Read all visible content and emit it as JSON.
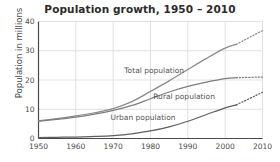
{
  "chart_data": {
    "type": "line",
    "title": "Population growth, 1950 – 2010",
    "xlabel": "",
    "ylabel": "Population in millions",
    "xlim": [
      1950,
      2010
    ],
    "ylim": [
      0,
      40
    ],
    "grid": true,
    "legend_position": "inline-labels",
    "xticks": [
      "1950",
      "1960",
      "1970",
      "1980",
      "1990",
      "2000",
      "2010"
    ],
    "yticks": [
      "0",
      "10",
      "20",
      "30",
      "40"
    ],
    "x": [
      1950,
      1955,
      1960,
      1965,
      1970,
      1975,
      1980,
      1985,
      1990,
      1995,
      2000,
      2003,
      2010
    ],
    "series": [
      {
        "name": "Total population",
        "label": "Total population",
        "color": "#8a8a8a",
        "values": [
          6.1,
          6.8,
          7.7,
          8.8,
          10.2,
          12.6,
          16.1,
          19.7,
          23.6,
          27.4,
          30.9,
          32.2,
          36.9
        ],
        "solid_until": 2003,
        "projection_style": "dotted"
      },
      {
        "name": "Rural population",
        "label": "Rural population",
        "color": "#7d7d7d",
        "values": [
          5.9,
          6.5,
          7.3,
          8.3,
          9.6,
          11.3,
          13.6,
          15.9,
          17.8,
          19.3,
          20.5,
          20.8,
          21.0
        ],
        "solid_until": 2003,
        "projection_style": "dotted"
      },
      {
        "name": "Urban population",
        "label": "Urban population",
        "color": "#5f5f5f",
        "values": [
          0.3,
          0.4,
          0.5,
          0.7,
          1.0,
          1.6,
          2.6,
          4.0,
          5.9,
          8.2,
          10.5,
          11.5,
          15.8
        ],
        "solid_until": 2003,
        "projection_style": "dotted"
      }
    ],
    "annotations": [
      {
        "text": "Total population",
        "x": 1981,
        "y": 22.5
      },
      {
        "text": "Rural population",
        "x": 1989,
        "y": 13.6
      },
      {
        "text": "Urban population",
        "x": 1978,
        "y": 6.3
      }
    ]
  }
}
